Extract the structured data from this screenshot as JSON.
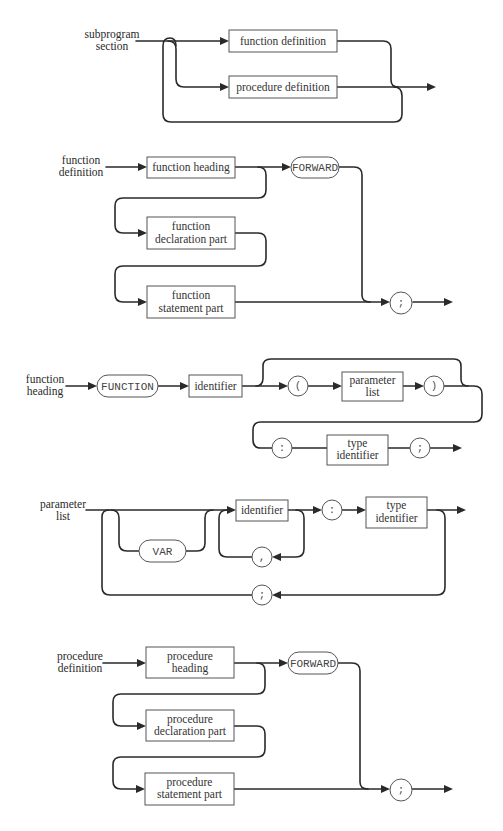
{
  "diagrams": {
    "subprogram_section": {
      "label": [
        "subprogram",
        "section"
      ],
      "boxes": [
        "function definition",
        "procedure definition"
      ]
    },
    "function_definition": {
      "label": [
        "function",
        "definition"
      ],
      "heading": "function heading",
      "declaration": [
        "function",
        "declaration part"
      ],
      "statement": [
        "function",
        "statement part"
      ],
      "forward": "FORWARD",
      "terminator": ";"
    },
    "function_heading": {
      "label": [
        "function",
        "heading"
      ],
      "keyword": "FUNCTION",
      "identifier": "identifier",
      "open_paren": "(",
      "parameter_list": [
        "parameter",
        "list"
      ],
      "close_paren": ")",
      "colon": ":",
      "type_identifier": [
        "type",
        "identifier"
      ],
      "terminator": ";"
    },
    "parameter_list": {
      "label": [
        "parameter",
        "list"
      ],
      "var": "VAR",
      "identifier": "identifier",
      "comma": ",",
      "colon": ":",
      "type_identifier": [
        "type",
        "identifier"
      ],
      "separator": ";"
    },
    "procedure_definition": {
      "label": [
        "procedure",
        "definition"
      ],
      "heading": [
        "procedure",
        "heading"
      ],
      "declaration": [
        "procedure",
        "declaration part"
      ],
      "statement": [
        "procedure",
        "statement part"
      ],
      "forward": "FORWARD",
      "terminator": ";"
    }
  },
  "colors": {
    "line": "#2a2a2a",
    "border": "#555555",
    "background": "#ffffff"
  }
}
